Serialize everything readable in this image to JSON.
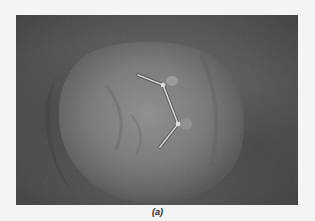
{
  "figure": {
    "caption": "(a)",
    "colors": {
      "background": "#f4f4f4",
      "photo_dark": "#3c3c3c",
      "photo_mid": "#6a6a6a",
      "organ_light": "#8a8a8a",
      "wire": "#cfcfcf"
    }
  }
}
